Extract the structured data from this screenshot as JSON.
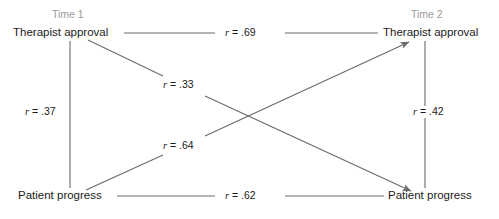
{
  "diagram": {
    "type": "cross-lagged-panel-correlation",
    "background": "#ffffff",
    "line_color": "#6a6a6a",
    "text_color": "#1a1a1a",
    "header_color": "#9a9a9a",
    "headers": [
      {
        "id": "time1",
        "label": "Time 1"
      },
      {
        "id": "time2",
        "label": "Time 2"
      }
    ],
    "nodes": [
      {
        "id": "ta-t1",
        "label": "Therapist approval",
        "wave": "Time 1"
      },
      {
        "id": "pp-t1",
        "label": "Patient progress",
        "wave": "Time 1"
      },
      {
        "id": "ta-t2",
        "label": "Therapist approval",
        "wave": "Time 2"
      },
      {
        "id": "pp-t2",
        "label": "Patient progress",
        "wave": "Time 2"
      }
    ],
    "paths": [
      {
        "id": "stability-therapist",
        "symbol": "r",
        "operator": "=",
        "value": ".69",
        "text": "r = .69",
        "from": "ta-t1",
        "to": "ta-t2",
        "kind": "horizontal",
        "arrow": false
      },
      {
        "id": "stability-patient",
        "symbol": "r",
        "operator": "=",
        "value": ".62",
        "text": "r = .62",
        "from": "pp-t1",
        "to": "pp-t2",
        "kind": "horizontal",
        "arrow": false
      },
      {
        "id": "synchronous-time1",
        "symbol": "r",
        "operator": "=",
        "value": ".37",
        "text": "r = .37",
        "from": "ta-t1",
        "to": "pp-t1",
        "kind": "vertical",
        "arrow": false
      },
      {
        "id": "synchronous-time2",
        "symbol": "r",
        "operator": "=",
        "value": ".42",
        "text": "r = .42",
        "from": "ta-t2",
        "to": "pp-t2",
        "kind": "vertical",
        "arrow": false
      },
      {
        "id": "crosslag-approval-to-progress",
        "symbol": "r",
        "operator": "=",
        "value": ".33",
        "text": "r = .33",
        "from": "ta-t1",
        "to": "pp-t2",
        "kind": "diagonal-descending",
        "arrow": true
      },
      {
        "id": "crosslag-progress-to-approval",
        "symbol": "r",
        "operator": "=",
        "value": ".64",
        "text": "r = .64",
        "from": "pp-t1",
        "to": "ta-t2",
        "kind": "diagonal-ascending",
        "arrow": true
      }
    ]
  }
}
